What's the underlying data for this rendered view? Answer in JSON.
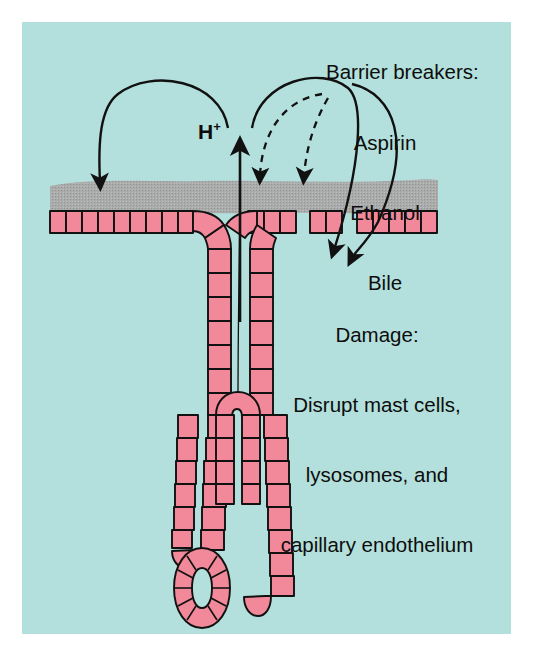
{
  "figure": {
    "background": "#ffffff",
    "panel_background": "#b3e0dc",
    "title_text": ""
  },
  "labels": {
    "barrier_breakers_heading": "Barrier breakers:",
    "barrier_breakers_items": [
      "Aspirin",
      "Ethanol",
      "Bile"
    ],
    "damage_heading": "Damage:",
    "damage_lines": [
      "Disrupt mast cells,",
      "lysosomes, and",
      "capillary endothelium"
    ],
    "acid_label": "H",
    "acid_label_sup": "+"
  },
  "diagram": {
    "type": "gastric-mucosa-cross-section",
    "mucus_layer_color": "#a8a8a8",
    "epithelial_cell_fill": "#f2899a",
    "epithelial_cell_stroke": "#111111",
    "arrow_color": "#111111",
    "structures": [
      "mucus-barrier-layer",
      "surface-epithelium",
      "gastric-pit",
      "gastric-gland-tubules",
      "gland-cross-section-oval"
    ],
    "arrows": [
      {
        "name": "acid-secretion-arrow",
        "style": "solid",
        "direction": "up",
        "meaning": "H+ secreted from gland"
      },
      {
        "name": "acid-back-diffusion-left-arc",
        "style": "solid",
        "direction": "down-left",
        "meaning": "H+ back-diffusion into intact mucosa"
      },
      {
        "name": "acid-back-diffusion-right-arc",
        "style": "solid",
        "direction": "down-right",
        "meaning": "H+ back-diffusion through broken barrier"
      },
      {
        "name": "barrier-breaker-dashed-arrow-1",
        "style": "dashed",
        "direction": "down-left",
        "meaning": "Aspirin/Ethanol/Bile attacking barrier"
      },
      {
        "name": "barrier-breaker-dashed-arrow-2",
        "style": "dashed",
        "direction": "down-left",
        "meaning": "Aspirin/Ethanol/Bile attacking barrier"
      },
      {
        "name": "damage-arrow-1",
        "style": "solid",
        "direction": "down",
        "meaning": "leads to tissue damage"
      },
      {
        "name": "damage-arrow-2",
        "style": "solid",
        "direction": "down",
        "meaning": "leads to tissue damage"
      }
    ]
  }
}
